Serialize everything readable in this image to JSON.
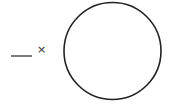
{
  "diagram": {
    "line": {
      "x1": 11,
      "y1": 56,
      "x2": 32,
      "y2": 56,
      "color": "#333333"
    },
    "label": {
      "text": "×"
    },
    "circle": {
      "cx": 112.5,
      "cy": 51,
      "r": 48.5,
      "stroke": "#222222",
      "stroke_width": 1.6
    }
  }
}
